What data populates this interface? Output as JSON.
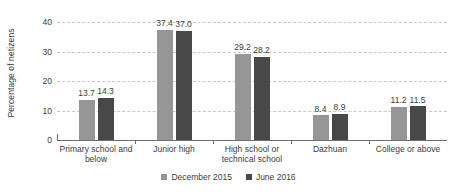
{
  "chart_data": {
    "type": "bar",
    "title": "",
    "xlabel": "",
    "ylabel": "Percentage of netizens",
    "ylim": [
      0,
      40
    ],
    "yticks": [
      0,
      10,
      20,
      30,
      40
    ],
    "ytick_labels": [
      "0",
      "10",
      "20",
      "30",
      "40"
    ],
    "grid": true,
    "legend_position": "bottom",
    "categories": [
      "Primary school and below",
      "Junior high",
      "High school or technical school",
      "Dazhuan",
      "College or above"
    ],
    "category_lines": [
      [
        "Primary school and",
        "below"
      ],
      [
        "Junior high"
      ],
      [
        "High school or",
        "technical school"
      ],
      [
        "Dazhuan"
      ],
      [
        "College or above"
      ]
    ],
    "series": [
      {
        "name": "December 2015",
        "color": "#969696",
        "values": [
          13.7,
          37.4,
          29.2,
          8.4,
          11.2
        ],
        "labels": [
          "13.7",
          "37.4",
          "29.2",
          "8.4",
          "11.2"
        ]
      },
      {
        "name": "June 2016",
        "color": "#484848",
        "values": [
          14.3,
          37.0,
          28.2,
          8.9,
          11.5
        ],
        "labels": [
          "14.3",
          "37.0",
          "28.2",
          "8.9",
          "11.5"
        ]
      }
    ]
  },
  "colors": {
    "background": "#ffffff",
    "text": "#3c3c3c",
    "gridline": "#c8c8c8",
    "axis": "#707070",
    "series_december_2015": "#969696",
    "series_june_2016": "#484848"
  }
}
